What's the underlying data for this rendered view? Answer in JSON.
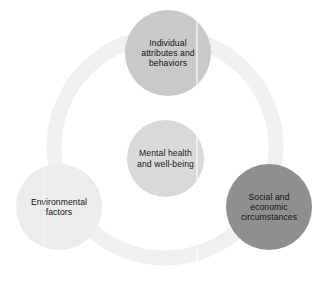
{
  "diagram": {
    "type": "circular-relationship-diagram",
    "background_color": "#ffffff",
    "ring": {
      "name": "connecting-ring",
      "color": "#f0f0f0",
      "center_x": 165,
      "center_y": 147,
      "radius": 118,
      "thickness": 15
    },
    "nodes": [
      {
        "id": "individual",
        "label": "Individual\nattributes and\nbehaviors",
        "color": "#c9c9c9",
        "text_color": "#111111",
        "position": "top",
        "center_x": 168,
        "center_y": 53,
        "diameter": 86
      },
      {
        "id": "mental",
        "label": "Mental health\nand well-being",
        "color": "#d9d9d9",
        "text_color": "#1a1a1a",
        "position": "center",
        "center_x": 165,
        "center_y": 158,
        "diameter": 77
      },
      {
        "id": "social",
        "label": "Social and\neconomic\ncircumstances",
        "color": "#8f8f8f",
        "text_color": "#141414",
        "position": "bottom-right",
        "center_x": 269,
        "center_y": 207,
        "diameter": 86
      },
      {
        "id": "environmental",
        "label": "Environmental\nfactors",
        "color": "#ececec",
        "text_color": "#131313",
        "position": "bottom-left",
        "center_x": 59,
        "center_y": 207,
        "diameter": 86
      }
    ]
  }
}
